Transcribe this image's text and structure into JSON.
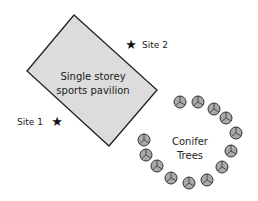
{
  "building": {
    "label_line1": "Single storey",
    "label_line2": "sports pavilion",
    "fill": "#dcdcdc",
    "stroke": "#222222"
  },
  "sites": [
    {
      "label": "Site 1",
      "icon": "star-icon"
    },
    {
      "label": "Site 2",
      "icon": "star-icon"
    }
  ],
  "trees": {
    "label_line1": "Conifer",
    "label_line2": "Trees",
    "count": 13,
    "fill": "#a9a9a9",
    "icon": "tree-icon"
  }
}
